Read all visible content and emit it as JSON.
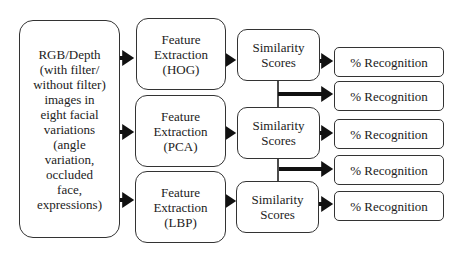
{
  "diagram": {
    "input": {
      "lines": [
        "RGB/Depth",
        "(with filter/",
        "without filter)",
        "images in",
        "eight facial",
        "variations",
        "(angle",
        "variation,",
        "occluded",
        "face,",
        "expressions)"
      ]
    },
    "feature_extraction": [
      {
        "lines": [
          "Feature",
          "Extraction",
          "(HOG)"
        ]
      },
      {
        "lines": [
          "Feature",
          "Extraction",
          "(PCA)"
        ]
      },
      {
        "lines": [
          "Feature",
          "Extraction",
          "(LBP)"
        ]
      }
    ],
    "similarity": [
      {
        "lines": [
          "Similarity",
          "Scores"
        ]
      },
      {
        "lines": [
          "Similarity",
          "Scores"
        ]
      },
      {
        "lines": [
          "Similarity",
          "Scores"
        ]
      }
    ],
    "recognition": [
      {
        "label": "% Recognition"
      },
      {
        "label": "% Recognition"
      },
      {
        "label": "% Recognition"
      },
      {
        "label": "% Recognition"
      },
      {
        "label": "% Recognition"
      }
    ]
  }
}
